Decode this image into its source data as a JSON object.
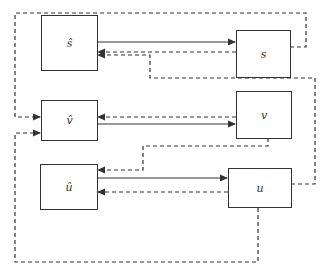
{
  "diagram": {
    "nodes": [
      {
        "id": "s_hat",
        "label": "ŝ"
      },
      {
        "id": "s",
        "label": "s"
      },
      {
        "id": "v_hat",
        "label": "v̂"
      },
      {
        "id": "v",
        "label": "v"
      },
      {
        "id": "u_hat",
        "label": "û"
      },
      {
        "id": "u",
        "label": "u"
      }
    ],
    "edges": [
      {
        "from": "s_hat",
        "to": "s",
        "style": "solid"
      },
      {
        "from": "s",
        "to": "s_hat",
        "style": "dashed"
      },
      {
        "from": "u",
        "to": "s_hat",
        "style": "dashed"
      },
      {
        "from": "s",
        "to": "v_hat",
        "style": "dashed"
      },
      {
        "from": "v_hat",
        "to": "v",
        "style": "solid"
      },
      {
        "from": "v",
        "to": "v_hat",
        "style": "dashed"
      },
      {
        "from": "v",
        "to": "u_hat",
        "style": "dashed"
      },
      {
        "from": "u_hat",
        "to": "u",
        "style": "solid"
      },
      {
        "from": "u",
        "to": "u_hat",
        "style": "dashed"
      },
      {
        "from": "u",
        "to": "v_hat",
        "style": "dashed"
      }
    ],
    "colors": {
      "line": "#333333",
      "background": "#ffffff"
    }
  }
}
